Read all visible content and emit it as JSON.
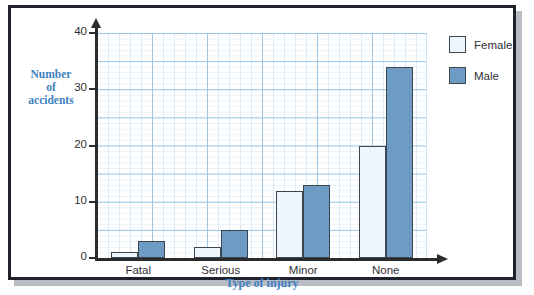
{
  "chart_data": {
    "type": "bar",
    "title": "",
    "xlabel": "Type of injury",
    "ylabel": "Number\nof\naccidents",
    "categories": [
      "Fatal",
      "Serious",
      "Minor",
      "None"
    ],
    "series": [
      {
        "name": "Female",
        "color": "#ecf6fc",
        "values": [
          1,
          2,
          12,
          20
        ]
      },
      {
        "name": "Male",
        "color": "#6d9bc4",
        "values": [
          3,
          5,
          13,
          34
        ]
      }
    ],
    "ylim": [
      0,
      40
    ],
    "yticks": [
      0,
      10,
      20,
      30,
      40
    ],
    "ytick_labels": [
      "0",
      "10",
      "20",
      "30",
      "40"
    ],
    "grid": true,
    "grid_major_step": 5,
    "grid_minor_step": 1,
    "legend_position": "right",
    "legend": [
      "Female",
      "Male"
    ]
  },
  "axes": {
    "y_title_lines": [
      "Number",
      "of",
      "accidents"
    ],
    "y_title_color": "#3f7fc1",
    "x_title": "Type of injury",
    "x_title_color": "#3f7fc1"
  },
  "legend": {
    "items": [
      {
        "label": "Female",
        "color": "#ecf6fc"
      },
      {
        "label": "Male",
        "color": "#6d9bc4"
      }
    ]
  },
  "colors": {
    "frame": "#20222b",
    "shadow": "#b9bcc4",
    "grid_major": "#9dc6e4",
    "grid_minor": "#e3eff8",
    "bar_outline": "#3c4650",
    "axis": "#2b2b2b",
    "tick_text": "#2f3033"
  }
}
